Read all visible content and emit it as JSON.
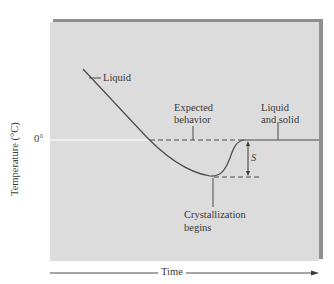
{
  "diagram": {
    "type": "cooling-curve",
    "axes": {
      "y_label": "Temperature (°C)",
      "y_tick_zero": "0°",
      "x_label": "Time"
    },
    "annotations": {
      "liquid": "Liquid",
      "expected_line1": "Expected",
      "expected_line2": "behavior",
      "liquid_solid_line1": "Liquid",
      "liquid_solid_line2": "and solid",
      "supercooling_symbol": "S",
      "crystallization_line1": "Crystallization",
      "crystallization_line2": "begins"
    },
    "colors": {
      "panel_background": "#dcdcdc",
      "panel_shadow": "#8f8f8f",
      "curve": "#4a4a4a",
      "zero_line": "#ffffff",
      "text": "#3a3a3a"
    }
  }
}
